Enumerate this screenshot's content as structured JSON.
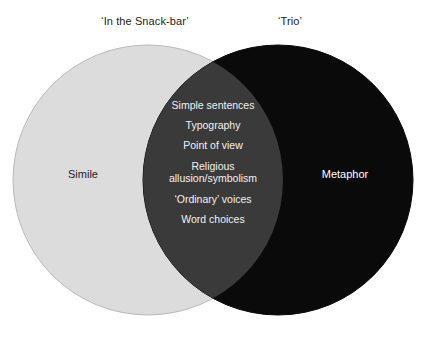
{
  "diagram": {
    "type": "venn",
    "left_set": {
      "title": "‘In the Snack-bar’",
      "label": "Simile",
      "fill": "#dcdcdc",
      "text_color": "#1d1d1d"
    },
    "right_set": {
      "title": "‘Trio’",
      "label": "Metaphor",
      "fill": "#0a0a0a",
      "text_color": "#ffffff"
    },
    "overlap": {
      "fill": "#3a3a3a",
      "text_color": "#f2f2f2",
      "items": [
        "Simple sentences",
        "Typography",
        "Point of view",
        "Religious allusion/symbolism",
        "‘Ordinary’ voices",
        "Word choices"
      ]
    },
    "background": "#ffffff"
  }
}
